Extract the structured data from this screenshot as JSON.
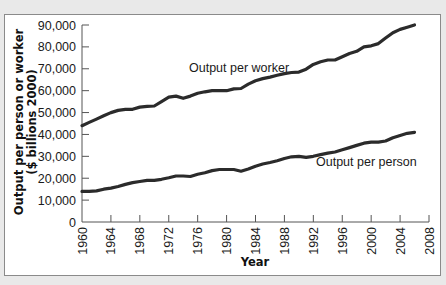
{
  "chart_data": {
    "type": "line",
    "title": "",
    "xlabel": "Year",
    "ylabel": "Output per person or worker ($ billions 2000)",
    "ylabel_lines": [
      "Output per person or worker",
      "($ billions 2000)"
    ],
    "xlim": [
      1960,
      2008
    ],
    "ylim": [
      0,
      90000
    ],
    "grid": false,
    "legend": "inline labels",
    "x_ticks": [
      1960,
      1964,
      1968,
      1972,
      1976,
      1980,
      1984,
      1988,
      1992,
      1996,
      2000,
      2004,
      2008
    ],
    "y_ticks": [
      0,
      10000,
      20000,
      30000,
      40000,
      50000,
      60000,
      70000,
      80000,
      90000
    ],
    "y_tick_labels": [
      "0",
      "10,000",
      "20,000",
      "30,000",
      "40,000",
      "50,000",
      "60,000",
      "70,000",
      "80,000",
      "90,000"
    ],
    "x": [
      1960,
      1961,
      1962,
      1963,
      1964,
      1965,
      1966,
      1967,
      1968,
      1969,
      1970,
      1971,
      1972,
      1973,
      1974,
      1975,
      1976,
      1977,
      1978,
      1979,
      1980,
      1981,
      1982,
      1983,
      1984,
      1985,
      1986,
      1987,
      1988,
      1989,
      1990,
      1991,
      1992,
      1993,
      1994,
      1995,
      1996,
      1997,
      1998,
      1999,
      2000,
      2001,
      2002,
      2003,
      2004,
      2005,
      2006
    ],
    "series": [
      {
        "name": "Output per worker",
        "values": [
          44000,
          45500,
          47000,
          48500,
          50000,
          51000,
          51500,
          51500,
          52500,
          52800,
          53000,
          55000,
          57000,
          57500,
          56500,
          57500,
          58800,
          59500,
          60000,
          60000,
          60000,
          60800,
          61000,
          63000,
          64500,
          65500,
          66200,
          67000,
          67800,
          68300,
          68500,
          69800,
          72000,
          73200,
          74000,
          74000,
          75500,
          77000,
          78000,
          80000,
          80500,
          81500,
          84000,
          86500,
          88000,
          89000,
          90000
        ]
      },
      {
        "name": "Output per person",
        "values": [
          14000,
          14000,
          14200,
          15000,
          15500,
          16200,
          17200,
          18000,
          18500,
          19000,
          19000,
          19500,
          20200,
          21000,
          21000,
          20800,
          21800,
          22500,
          23500,
          24000,
          24000,
          24000,
          23200,
          24200,
          25500,
          26500,
          27200,
          28000,
          29000,
          29800,
          30000,
          29500,
          30000,
          30800,
          31500,
          32000,
          33000,
          34000,
          35000,
          36000,
          36500,
          36500,
          37000,
          38500,
          39500,
          40500,
          41000
        ]
      }
    ],
    "annotations": [
      {
        "text": "Output per worker",
        "x": 1979,
        "y": 65500
      },
      {
        "text": "Output per person",
        "x": 1991,
        "y": 23500
      }
    ]
  },
  "labels": {
    "worker": "Output per worker",
    "person": "Output per person",
    "xlabel": "Year",
    "ylabel1": "Output per person or worker",
    "ylabel2": "($ billions 2000)"
  },
  "colors": {
    "line": "#2b2b2b",
    "axis": "#555555",
    "background": "#ffffff",
    "page": "#e9e9e9"
  }
}
